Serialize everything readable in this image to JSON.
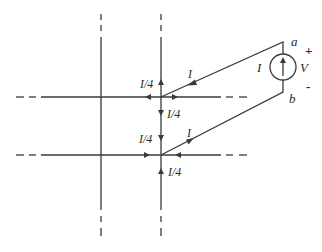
{
  "diagram": {
    "colors": {
      "line": "#3a3a3a",
      "background": "#ffffff"
    },
    "labels": {
      "quarter_current": "I/4",
      "current": "I",
      "source_current": "I",
      "voltage": "V",
      "node_a": "a",
      "node_b": "b",
      "plus": "+",
      "minus": "-"
    },
    "grid": {
      "vertical_lines_x": [
        101,
        161
      ],
      "horizontal_lines_y": [
        97,
        155
      ],
      "line_style": "solid center with dashed ends (infinite grid)"
    },
    "source": {
      "type": "current source",
      "symbol": "circle with upward arrow",
      "center": [
        283,
        67
      ],
      "radius": 13,
      "terminal_top": "a",
      "terminal_bottom": "b"
    },
    "currents": [
      {
        "node": "upper junction",
        "branch": "up",
        "label": "I/4",
        "direction": "away"
      },
      {
        "node": "upper junction",
        "branch": "left",
        "label": "I/4",
        "direction": "away"
      },
      {
        "node": "upper junction",
        "branch": "down",
        "label": "I/4",
        "direction": "away"
      },
      {
        "node": "upper junction",
        "branch": "right",
        "label": "I/4",
        "direction": "away"
      },
      {
        "node": "upper junction",
        "branch": "source wire",
        "label": "I",
        "direction": "into junction"
      },
      {
        "node": "lower junction",
        "branch": "up",
        "label": "I/4",
        "direction": "toward"
      },
      {
        "node": "lower junction",
        "branch": "left",
        "label": "I/4",
        "direction": "toward"
      },
      {
        "node": "lower junction",
        "branch": "down",
        "label": "I/4",
        "direction": "toward"
      },
      {
        "node": "lower junction",
        "branch": "right",
        "label": "I/4",
        "direction": "toward"
      },
      {
        "node": "lower junction",
        "branch": "source wire",
        "label": "I",
        "direction": "out of junction"
      }
    ]
  }
}
